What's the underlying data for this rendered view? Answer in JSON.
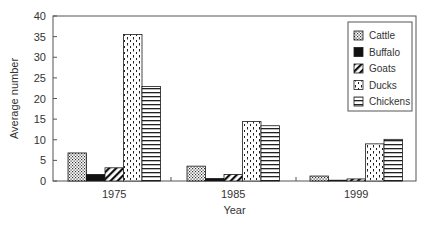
{
  "chart_data": {
    "type": "bar",
    "title": "",
    "xlabel": "Year",
    "ylabel": "Average number",
    "ylim": [
      0,
      40
    ],
    "yticks": [
      0,
      5,
      10,
      15,
      20,
      25,
      30,
      35,
      40
    ],
    "grid": false,
    "legend_position": "upper right (inside)",
    "categories": [
      "1975",
      "1985",
      "1999"
    ],
    "series": [
      {
        "name": "Cattle",
        "pattern": "dots",
        "values": [
          6.8,
          3.6,
          1.2
        ]
      },
      {
        "name": "Buffalo",
        "pattern": "solid",
        "values": [
          1.6,
          0.6,
          0.1
        ]
      },
      {
        "name": "Goats",
        "pattern": "diagonal",
        "values": [
          3.2,
          1.6,
          0.5
        ]
      },
      {
        "name": "Ducks",
        "pattern": "dashed-vertical",
        "values": [
          35.5,
          14.4,
          9.0
        ]
      },
      {
        "name": "Chickens",
        "pattern": "horizontal",
        "values": [
          22.9,
          13.4,
          10.1
        ]
      }
    ]
  },
  "colors": {
    "ink": "#1a1a1a",
    "axis": "#555555",
    "background": "#ffffff"
  }
}
